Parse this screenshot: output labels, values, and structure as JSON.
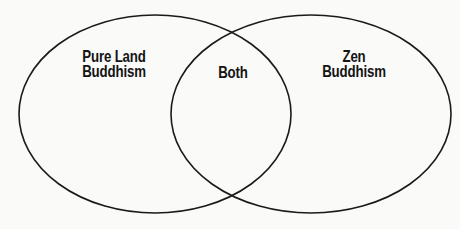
{
  "diagram": {
    "type": "venn",
    "stroke_color": "#1a1a1a",
    "background_color": "#fafaf8",
    "sets": [
      {
        "name": "left",
        "label_lines": [
          "Pure Land",
          "Buddhism"
        ],
        "ellipse": {
          "cx": 155,
          "cy": 114,
          "rx": 136,
          "ry": 99
        }
      },
      {
        "name": "right",
        "label_lines": [
          "Zen",
          "Buddhism"
        ],
        "ellipse": {
          "cx": 311,
          "cy": 114,
          "rx": 140,
          "ry": 99
        }
      }
    ],
    "intersection": {
      "label": "Both"
    }
  }
}
